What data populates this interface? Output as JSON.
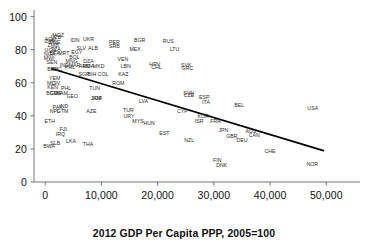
{
  "chart_data": {
    "type": "scatter",
    "title": "",
    "xlabel": "2012 GDP Per Capita PPP, 2005=100",
    "ylabel": "",
    "xlim": [
      -2000,
      56000
    ],
    "ylim": [
      0,
      104
    ],
    "xticks": [
      0,
      10000,
      20000,
      30000,
      40000,
      50000
    ],
    "xtick_labels": [
      "0",
      "10,000",
      "20,000",
      "30,000",
      "40,000",
      "50,000"
    ],
    "yticks": [
      0,
      20,
      40,
      60,
      80,
      100
    ],
    "ytick_labels": [
      "0",
      "20",
      "40",
      "60",
      "80",
      "100"
    ],
    "grid": false,
    "legend": null,
    "marker_style": "text-label",
    "trendline": {
      "type": "linear",
      "color": "#000000",
      "x_start": 1200,
      "y_start": 68.5,
      "x_end": 49500,
      "y_end": 19.0
    },
    "points": [
      {
        "label": "AGO",
        "x": 900,
        "y": 86.0
      },
      {
        "label": "UZB",
        "x": 1900,
        "y": 87.0
      },
      {
        "label": "MOZ",
        "x": 2300,
        "y": 88.0
      },
      {
        "label": "ZAF",
        "x": 800,
        "y": 84.5
      },
      {
        "label": "ZWE",
        "x": 1700,
        "y": 84.0
      },
      {
        "label": "IDN",
        "x": 5300,
        "y": 85.0
      },
      {
        "label": "UKR",
        "x": 7700,
        "y": 86.0
      },
      {
        "label": "PER",
        "x": 12300,
        "y": 84.0
      },
      {
        "label": "BGR",
        "x": 16800,
        "y": 85.0
      },
      {
        "label": "RUS",
        "x": 21900,
        "y": 84.5
      },
      {
        "label": "ZMB",
        "x": 1400,
        "y": 82.0
      },
      {
        "label": "UGA",
        "x": 900,
        "y": 79.5
      },
      {
        "label": "TZA",
        "x": 1900,
        "y": 80.0
      },
      {
        "label": "SLV",
        "x": 6400,
        "y": 80.5
      },
      {
        "label": "ALB",
        "x": 8500,
        "y": 80.5
      },
      {
        "label": "SRB",
        "x": 12300,
        "y": 81.5
      },
      {
        "label": "MEX",
        "x": 16000,
        "y": 80.0
      },
      {
        "label": "LTU",
        "x": 23000,
        "y": 80.0
      },
      {
        "label": "NGA",
        "x": 800,
        "y": 77.0
      },
      {
        "label": "BFA",
        "x": 1700,
        "y": 77.5
      },
      {
        "label": "EGY",
        "x": 5600,
        "y": 78.0
      },
      {
        "label": "MRT",
        "x": 3300,
        "y": 77.5
      },
      {
        "label": "MWI",
        "x": 700,
        "y": 74.5
      },
      {
        "label": "BOL",
        "x": 5200,
        "y": 75.0
      },
      {
        "label": "MNG",
        "x": 4700,
        "y": 72.5
      },
      {
        "label": "DZA",
        "x": 7700,
        "y": 72.5
      },
      {
        "label": "VEN",
        "x": 13800,
        "y": 74.0
      },
      {
        "label": "SEN",
        "x": 1200,
        "y": 72.0
      },
      {
        "label": "IND",
        "x": 3400,
        "y": 70.0
      },
      {
        "label": "MAR",
        "x": 5200,
        "y": 70.0
      },
      {
        "label": "ARM",
        "x": 7000,
        "y": 69.5
      },
      {
        "label": "MDA",
        "x": 7700,
        "y": 69.5
      },
      {
        "label": "PHL",
        "x": 4400,
        "y": 69.0
      },
      {
        "label": "MKD",
        "x": 9500,
        "y": 69.5
      },
      {
        "label": "LBN",
        "x": 14300,
        "y": 69.5
      },
      {
        "label": "HRV",
        "x": 19500,
        "y": 70.5
      },
      {
        "label": "CHL",
        "x": 19800,
        "y": 69.0
      },
      {
        "label": "SVK",
        "x": 25100,
        "y": 70.0
      },
      {
        "label": "GRC",
        "x": 25300,
        "y": 68.5
      },
      {
        "label": "BEN",
        "x": 1300,
        "y": 67.5
      },
      {
        "label": "NIC",
        "x": 2200,
        "y": 67.5
      },
      {
        "label": "SGP",
        "x": 6900,
        "y": 65.0
      },
      {
        "label": "BIH",
        "x": 8300,
        "y": 65.0
      },
      {
        "label": "COL",
        "x": 10300,
        "y": 64.5
      },
      {
        "label": "KAZ",
        "x": 13900,
        "y": 64.5
      },
      {
        "label": "YEM",
        "x": 1700,
        "y": 62.5
      },
      {
        "label": "MLI",
        "x": 1100,
        "y": 59.5
      },
      {
        "label": "CIV",
        "x": 1900,
        "y": 59.0
      },
      {
        "label": "KEN",
        "x": 1300,
        "y": 57.0
      },
      {
        "label": "PHL2",
        "x": 3700,
        "y": 56.5
      },
      {
        "label": "TUN",
        "x": 8800,
        "y": 56.5
      },
      {
        "label": "ROM",
        "x": 13000,
        "y": 59.5
      },
      {
        "label": "BGD",
        "x": 1200,
        "y": 53.0
      },
      {
        "label": "CMR",
        "x": 1900,
        "y": 53.5
      },
      {
        "label": "NAM",
        "x": 3000,
        "y": 53.0
      },
      {
        "label": "GEO",
        "x": 4800,
        "y": 51.5
      },
      {
        "label": "JAM",
        "x": 9000,
        "y": 50.0
      },
      {
        "label": "JOR",
        "x": 9200,
        "y": 50.0
      },
      {
        "label": "LVA",
        "x": 17500,
        "y": 48.5
      },
      {
        "label": "SVN",
        "x": 25500,
        "y": 53.5
      },
      {
        "label": "CZE",
        "x": 25600,
        "y": 52.0
      },
      {
        "label": "ESP",
        "x": 28300,
        "y": 51.0
      },
      {
        "label": "ITA",
        "x": 28600,
        "y": 48.0
      },
      {
        "label": "PAK",
        "x": 2200,
        "y": 45.0
      },
      {
        "label": "IND2",
        "x": 3300,
        "y": 45.5
      },
      {
        "label": "NPL",
        "x": 1700,
        "y": 42.5
      },
      {
        "label": "GTM",
        "x": 3100,
        "y": 42.5
      },
      {
        "label": "AZE",
        "x": 8200,
        "y": 42.5
      },
      {
        "label": "TUR",
        "x": 14800,
        "y": 43.0
      },
      {
        "label": "URY",
        "x": 14900,
        "y": 39.5
      },
      {
        "label": "CYP",
        "x": 24400,
        "y": 42.5
      },
      {
        "label": "BEL",
        "x": 34500,
        "y": 46.0
      },
      {
        "label": "USA",
        "x": 47600,
        "y": 44.0
      },
      {
        "label": "ETH",
        "x": 800,
        "y": 36.5
      },
      {
        "label": "MYS",
        "x": 16500,
        "y": 36.5
      },
      {
        "label": "HUN",
        "x": 18500,
        "y": 35.0
      },
      {
        "label": "KOR",
        "x": 28100,
        "y": 39.5
      },
      {
        "label": "ISR",
        "x": 27400,
        "y": 36.0
      },
      {
        "label": "FRA",
        "x": 30300,
        "y": 36.5
      },
      {
        "label": "FJI",
        "x": 3200,
        "y": 31.5
      },
      {
        "label": "IRQ",
        "x": 2700,
        "y": 28.5
      },
      {
        "label": "EST",
        "x": 21200,
        "y": 29.0
      },
      {
        "label": "JPN",
        "x": 31700,
        "y": 31.0
      },
      {
        "label": "AUS",
        "x": 36600,
        "y": 30.0
      },
      {
        "label": "CAN",
        "x": 37200,
        "y": 28.0
      },
      {
        "label": "GBR",
        "x": 33200,
        "y": 27.0
      },
      {
        "label": "NZL",
        "x": 25600,
        "y": 24.5
      },
      {
        "label": "DEU",
        "x": 35000,
        "y": 24.5
      },
      {
        "label": "SLB",
        "x": 1800,
        "y": 23.0
      },
      {
        "label": "LKA",
        "x": 4600,
        "y": 24.0
      },
      {
        "label": "THA",
        "x": 7600,
        "y": 22.5
      },
      {
        "label": "BWA",
        "x": 700,
        "y": 21.0
      },
      {
        "label": "CHE",
        "x": 40000,
        "y": 18.0
      },
      {
        "label": "FIN",
        "x": 30600,
        "y": 12.5
      },
      {
        "label": "DNK",
        "x": 31400,
        "y": 9.5
      },
      {
        "label": "NOR",
        "x": 47500,
        "y": 10.0
      }
    ]
  },
  "axis": {
    "x_title": "2012 GDP Per Capita PPP, 2005=100"
  }
}
